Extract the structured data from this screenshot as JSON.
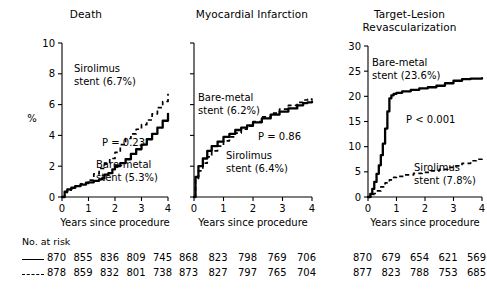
{
  "figure": {
    "x_axis_caption": "Years since procedure",
    "x_ticks": [
      "0",
      "1",
      "2",
      "3",
      "4"
    ],
    "y_label_percent": "%"
  },
  "panels": [
    {
      "title": "Death",
      "y_ticks": [
        "0",
        "2",
        "4",
        "6",
        "8",
        "10"
      ],
      "p_value": "P = 0.23",
      "annotations": [
        {
          "line1": "Sirolimus",
          "line2": "stent (6.7%)"
        },
        {
          "line1": "Bare-metal",
          "line2": "stent (5.3%)"
        }
      ]
    },
    {
      "title": "Myocardial Infarction",
      "y_ticks": [
        "",
        "",
        "",
        "",
        "",
        ""
      ],
      "p_value": "P = 0.86",
      "annotations": [
        {
          "line1": "Bare-metal",
          "line2": "stent (6.2%)"
        },
        {
          "line1": "Sirolimus",
          "line2": "stent (6.4%)"
        }
      ]
    },
    {
      "title_line1": "Target-Lesion",
      "title_line2": "Revascularization",
      "y_ticks": [
        "0",
        "5",
        "10",
        "15",
        "20",
        "25",
        "30"
      ],
      "p_value": "P < 0.001",
      "annotations": [
        {
          "line1": "Bare-metal",
          "line2": "stent (23.6%)"
        },
        {
          "line1": "Sirolimus",
          "line2": "stent (7.8%)"
        }
      ]
    }
  ],
  "risk_table": {
    "title": "No. at risk",
    "rows": [
      {
        "style": "solid",
        "death": [
          "870",
          "855",
          "836",
          "809",
          "745"
        ],
        "mi": [
          "868",
          "823",
          "798",
          "769",
          "706"
        ],
        "tlr": [
          "870",
          "679",
          "654",
          "621",
          "569"
        ]
      },
      {
        "style": "dashed",
        "death": [
          "878",
          "859",
          "832",
          "801",
          "738"
        ],
        "mi": [
          "873",
          "827",
          "797",
          "765",
          "704"
        ],
        "tlr": [
          "877",
          "823",
          "788",
          "753",
          "685"
        ]
      }
    ]
  },
  "chart_data": [
    {
      "type": "line",
      "title": "Death",
      "xlabel": "Years since procedure",
      "ylabel": "%",
      "xlim": [
        0,
        4
      ],
      "ylim": [
        0,
        10
      ],
      "xticks": [
        0,
        1,
        2,
        3,
        4
      ],
      "yticks": [
        0,
        2,
        4,
        6,
        8,
        10
      ],
      "grid": false,
      "legend": "inline-annotations",
      "annotation_pvalue": "P = 0.23",
      "series": [
        {
          "name": "Bare-metal stent (5.3%)",
          "style": "solid",
          "final_value": 5.3,
          "x": [
            0,
            0.1,
            0.2,
            0.35,
            0.5,
            0.7,
            0.9,
            1.0,
            1.2,
            1.4,
            1.5,
            1.6,
            1.75,
            1.9,
            2.0,
            2.2,
            2.4,
            2.6,
            2.8,
            3.0,
            3.2,
            3.4,
            3.6,
            3.8,
            4.0
          ],
          "y": [
            0,
            0.35,
            0.5,
            0.6,
            0.7,
            0.8,
            0.9,
            0.95,
            1.05,
            1.15,
            1.2,
            1.45,
            1.55,
            1.8,
            2.0,
            2.2,
            2.45,
            2.8,
            3.1,
            3.4,
            3.75,
            4.1,
            4.5,
            4.95,
            5.4
          ]
        },
        {
          "name": "Sirolimus stent (6.7%)",
          "style": "dashed",
          "final_value": 6.7,
          "x": [
            0,
            0.1,
            0.2,
            0.35,
            0.5,
            0.7,
            0.9,
            1.0,
            1.2,
            1.4,
            1.6,
            1.8,
            2.0,
            2.2,
            2.4,
            2.6,
            2.8,
            3.0,
            3.2,
            3.4,
            3.6,
            3.8,
            4.0
          ],
          "y": [
            0,
            0.3,
            0.45,
            0.55,
            0.7,
            0.85,
            0.95,
            1.1,
            1.5,
            1.85,
            2.15,
            2.5,
            2.9,
            3.4,
            3.8,
            4.1,
            4.4,
            4.7,
            5.0,
            5.4,
            5.8,
            6.2,
            6.7
          ]
        }
      ]
    },
    {
      "type": "line",
      "title": "Myocardial Infarction",
      "xlabel": "Years since procedure",
      "ylabel": "%",
      "xlim": [
        0,
        4
      ],
      "ylim": [
        0,
        10
      ],
      "xticks": [
        0,
        1,
        2,
        3,
        4
      ],
      "yticks": [
        0,
        2,
        4,
        6,
        8,
        10
      ],
      "grid": false,
      "legend": "inline-annotations",
      "annotation_pvalue": "P = 0.86",
      "series": [
        {
          "name": "Bare-metal stent (6.2%)",
          "style": "solid",
          "final_value": 6.2,
          "x": [
            0,
            0.05,
            0.15,
            0.3,
            0.45,
            0.6,
            0.8,
            1.0,
            1.2,
            1.4,
            1.6,
            1.8,
            2.0,
            2.3,
            2.6,
            2.9,
            3.2,
            3.5,
            3.7,
            3.85,
            4.0
          ],
          "y": [
            0,
            1.3,
            2.0,
            2.5,
            3.0,
            3.3,
            3.6,
            3.9,
            4.1,
            4.35,
            4.5,
            4.65,
            4.85,
            5.1,
            5.35,
            5.55,
            5.75,
            5.95,
            6.1,
            6.15,
            6.2
          ]
        },
        {
          "name": "Sirolimus stent (6.4%)",
          "style": "dashed",
          "final_value": 6.4,
          "x": [
            0,
            0.05,
            0.15,
            0.3,
            0.45,
            0.6,
            0.8,
            1.0,
            1.2,
            1.4,
            1.6,
            1.8,
            2.0,
            2.3,
            2.6,
            2.9,
            3.2,
            3.5,
            3.7,
            3.85,
            4.0
          ],
          "y": [
            0,
            1.1,
            1.7,
            2.2,
            2.6,
            3.0,
            3.3,
            3.65,
            3.9,
            4.15,
            4.4,
            4.6,
            4.9,
            5.2,
            5.45,
            5.7,
            5.95,
            6.15,
            6.3,
            6.35,
            6.4
          ]
        }
      ]
    },
    {
      "type": "line",
      "title": "Target-Lesion Revascularization",
      "xlabel": "Years since procedure",
      "ylabel": "%",
      "xlim": [
        0,
        4
      ],
      "ylim": [
        0,
        30
      ],
      "xticks": [
        0,
        1,
        2,
        3,
        4
      ],
      "yticks": [
        0,
        5,
        10,
        15,
        20,
        25,
        30
      ],
      "grid": false,
      "legend": "inline-annotations",
      "annotation_pvalue": "P < 0.001",
      "series": [
        {
          "name": "Bare-metal stent (23.6%)",
          "style": "solid",
          "final_value": 23.6,
          "x": [
            0,
            0.08,
            0.15,
            0.22,
            0.3,
            0.38,
            0.45,
            0.52,
            0.6,
            0.68,
            0.75,
            0.82,
            0.9,
            1.0,
            1.2,
            1.5,
            1.8,
            2.1,
            2.4,
            2.7,
            3.0,
            3.3,
            3.6,
            4.0
          ],
          "y": [
            0,
            0.6,
            1.6,
            3.0,
            4.6,
            6.3,
            8.3,
            10.6,
            13.6,
            17.0,
            19.6,
            20.2,
            20.5,
            20.7,
            21.0,
            21.3,
            21.6,
            21.8,
            22.1,
            22.6,
            23.1,
            23.4,
            23.5,
            23.6
          ]
        },
        {
          "name": "Sirolimus stent (7.8%)",
          "style": "dashed",
          "final_value": 7.8,
          "x": [
            0,
            0.1,
            0.2,
            0.3,
            0.45,
            0.6,
            0.75,
            0.9,
            1.0,
            1.3,
            1.6,
            1.9,
            2.2,
            2.5,
            2.8,
            3.0,
            3.3,
            3.6,
            3.8,
            4.0
          ],
          "y": [
            0,
            0.3,
            0.7,
            1.2,
            2.0,
            2.8,
            3.4,
            3.9,
            4.1,
            4.4,
            4.7,
            4.9,
            5.2,
            5.5,
            5.9,
            6.2,
            6.7,
            7.2,
            7.5,
            7.8
          ]
        }
      ]
    }
  ]
}
